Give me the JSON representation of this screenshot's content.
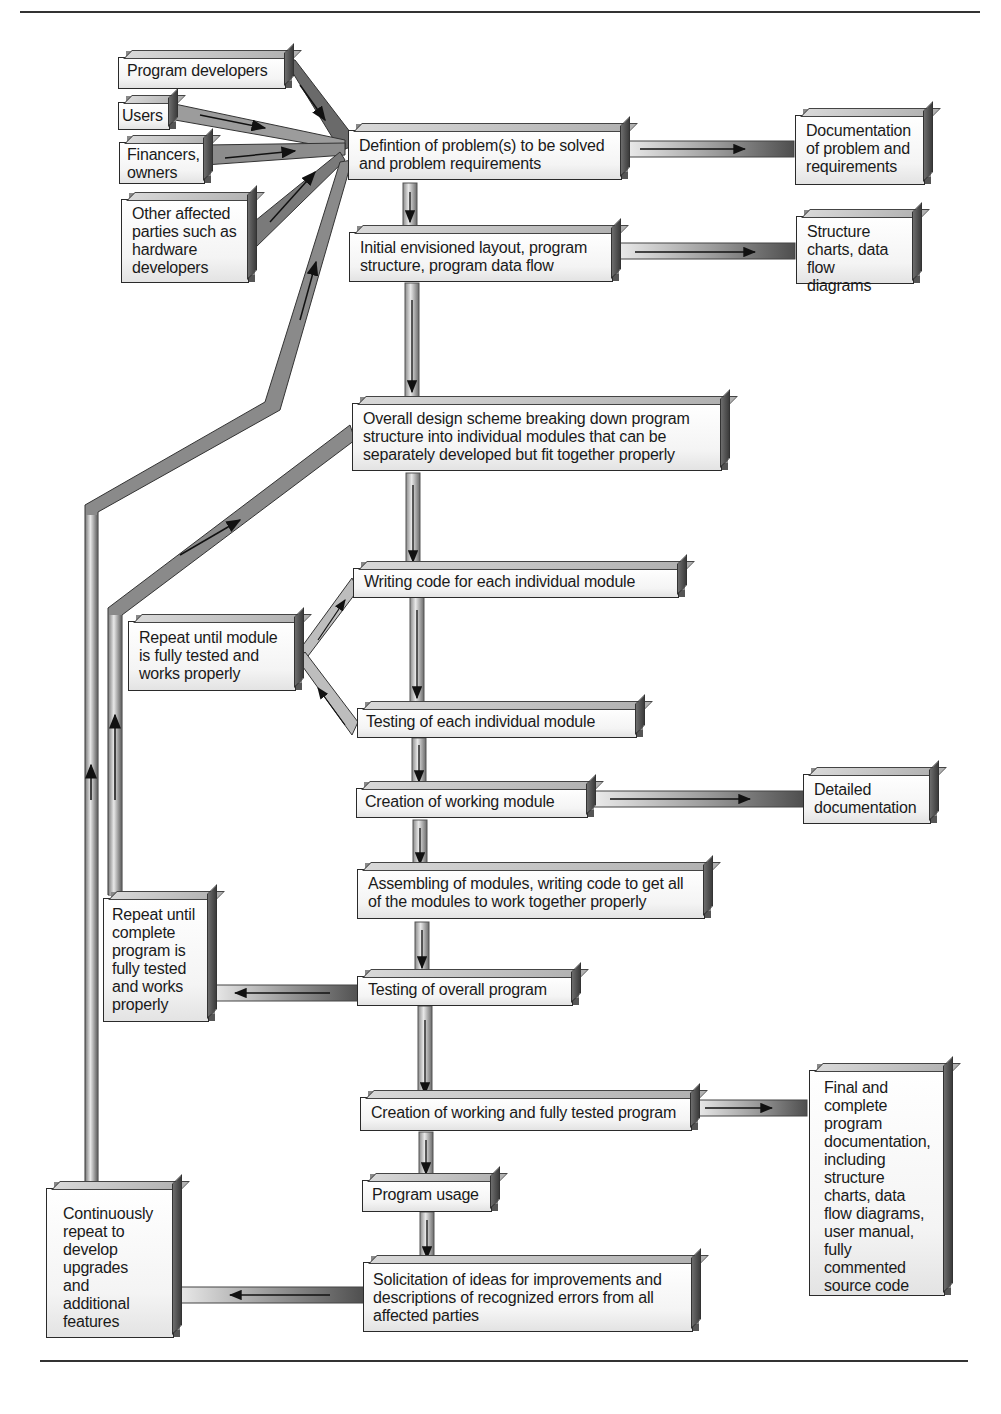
{
  "page": {
    "header_fragment": "...p..."
  },
  "sources": [
    {
      "id": "program-developers",
      "label": "Program developers"
    },
    {
      "id": "users",
      "label": "Users"
    },
    {
      "id": "financers",
      "label": "Financers, owners"
    },
    {
      "id": "other-parties",
      "label": "Other affected parties such as hardware developers"
    }
  ],
  "steps": [
    {
      "id": "definition",
      "label": "Defintion of problem(s) to be solved and problem requirements"
    },
    {
      "id": "initial-layout",
      "label": "Initial envisioned layout, program structure, program data flow"
    },
    {
      "id": "overall-design",
      "label": "Overall design scheme breaking down program structure into individual modules that can be separately developed but fit together properly"
    },
    {
      "id": "writing-code",
      "label": "Writing code for each individual module"
    },
    {
      "id": "testing-module",
      "label": "Testing of each individual module"
    },
    {
      "id": "working-module",
      "label": "Creation of working module"
    },
    {
      "id": "assembling",
      "label": "Assembling of modules, writing code to get all of the modules to work together properly"
    },
    {
      "id": "testing-overall",
      "label": "Testing of overall program"
    },
    {
      "id": "working-program",
      "label": "Creation of working and fully tested program"
    },
    {
      "id": "usage",
      "label": "Program usage"
    },
    {
      "id": "solicitation",
      "label": "Solicitation of ideas for improvements and descriptions of recognized errors from all affected parties"
    }
  ],
  "outputs": [
    {
      "id": "doc-problem",
      "label": "Documentation of problem and requirements"
    },
    {
      "id": "structure-charts",
      "label": "Structure charts, data flow diagrams"
    },
    {
      "id": "detailed-doc",
      "label": "Detailed documentation"
    },
    {
      "id": "final-doc",
      "label": "Final and complete program documentation, including structure charts, data flow diagrams, user manual, fully commented source code"
    }
  ],
  "loops": [
    {
      "id": "repeat-module",
      "label": "Repeat until module is fully tested and works properly"
    },
    {
      "id": "repeat-program",
      "label": "Repeat until complete program is fully tested and works properly"
    },
    {
      "id": "continuous",
      "label": "Continuously repeat to develop upgrades and additional features"
    }
  ],
  "colors": {
    "pipe_dark": "#5a5a5a",
    "pipe_light": "#d9d9d9",
    "border": "#2a2a2a",
    "rule": "#333333"
  }
}
